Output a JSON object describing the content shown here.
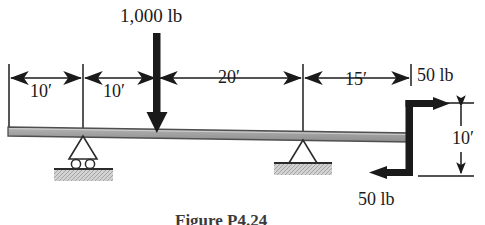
{
  "figure": {
    "caption": "Figure P4.24",
    "beam": {
      "name": "beam",
      "color": "#a8a8a8",
      "outline": "#4a4a4a"
    },
    "loads": [
      {
        "id": "point-load",
        "label": "1,000 lb",
        "magnitude": 1000,
        "unit": "lb",
        "direction": "down"
      },
      {
        "id": "force-top-right",
        "label": "50 lb",
        "magnitude": 50,
        "unit": "lb",
        "direction": "right"
      },
      {
        "id": "force-bottom-right",
        "label": "50 lb",
        "magnitude": 50,
        "unit": "lb",
        "direction": "left"
      }
    ],
    "dimensions": [
      {
        "id": "dim-1",
        "label": "10′",
        "value": 10,
        "unit": "ft",
        "orientation": "horizontal"
      },
      {
        "id": "dim-2",
        "label": "10′",
        "value": 10,
        "unit": "ft",
        "orientation": "horizontal"
      },
      {
        "id": "dim-3",
        "label": "20′",
        "value": 20,
        "unit": "ft",
        "orientation": "horizontal"
      },
      {
        "id": "dim-4",
        "label": "15′",
        "value": 15,
        "unit": "ft",
        "orientation": "horizontal"
      },
      {
        "id": "dim-5",
        "label": "10′",
        "value": 10,
        "unit": "ft",
        "orientation": "vertical"
      }
    ],
    "supports": [
      {
        "id": "support-left",
        "type": "roller"
      },
      {
        "id": "support-right",
        "type": "pin"
      }
    ],
    "colors": {
      "ink": "#1a1a1a",
      "beam_fill": "#a8a8a8",
      "ground_fill": "#c9c9c9",
      "thin_line": "#2b2b2b"
    }
  }
}
